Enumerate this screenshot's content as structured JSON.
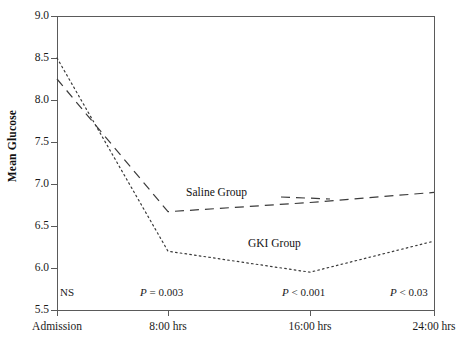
{
  "chart_data": {
    "type": "line",
    "title": "",
    "xlabel": "",
    "ylabel": "Mean Glucose",
    "ylim": [
      5.5,
      9.0
    ],
    "yticks": [
      "5.5",
      "6.0",
      "6.5",
      "7.0",
      "7.5",
      "8.0",
      "8.5",
      "9.0"
    ],
    "ytick_values": [
      5.5,
      6.0,
      6.5,
      7.0,
      7.5,
      8.0,
      8.5,
      9.0
    ],
    "categories": [
      "Admission",
      "8:00 hrs",
      "16:00 hrs",
      "24:00 hrs"
    ],
    "grid": false,
    "legend_position": "inline-annotation",
    "series": [
      {
        "name": "Saline Group",
        "style": "dashed",
        "values": [
          8.25,
          6.67,
          6.78,
          6.9
        ]
      },
      {
        "name": "GKI Group",
        "style": "dotted",
        "values": [
          8.5,
          6.2,
          5.95,
          6.32
        ]
      }
    ],
    "annotations": [
      {
        "text": "NS",
        "category": "Admission"
      },
      {
        "text": "P = 0.003",
        "category": "8:00 hrs"
      },
      {
        "text": "P < 0.001",
        "category": "16:00 hrs"
      },
      {
        "text": "P < 0.03",
        "category": "24:00 hrs"
      }
    ],
    "significance": {
      "admission": "NS",
      "h8_italic": "P",
      "h8_rest": " = 0.003",
      "h16_italic": "P",
      "h16_rest": " < 0.001",
      "h24_italic": "P",
      "h24_rest": " < 0.03"
    },
    "colors": {
      "axis": "#5a5a5a",
      "saline_line": "#3b3b3b",
      "gki_line": "#3b3b3b",
      "text": "#1a1a1a"
    }
  }
}
